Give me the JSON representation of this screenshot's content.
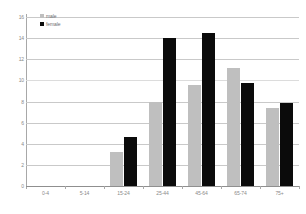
{
  "chart_data": {
    "type": "bar",
    "title": "",
    "subtitle": "",
    "xlabel": "",
    "ylabel": "",
    "categories": [
      "0-4",
      "5-14",
      "15-24",
      "25-44",
      "45-64",
      "65-74",
      "75+"
    ],
    "series": [
      {
        "name": "male",
        "color": "#bfbfbf",
        "values": [
          0,
          0,
          3.2,
          8.0,
          9.6,
          11.2,
          7.4
        ]
      },
      {
        "name": "female",
        "color": "#0b0b0b",
        "values": [
          0,
          0,
          4.6,
          14.0,
          14.5,
          9.8,
          7.9
        ]
      }
    ],
    "ylim": [
      0,
      16
    ],
    "yticks": [
      0,
      2,
      4,
      6,
      8,
      10,
      12,
      14,
      16
    ],
    "ytick_labels": [
      "0",
      "2",
      "4",
      "6",
      "8",
      "10",
      "12",
      "14",
      "16"
    ],
    "grid": true,
    "legend_position": "top-left",
    "legend_entries": [
      "male",
      "female"
    ]
  }
}
